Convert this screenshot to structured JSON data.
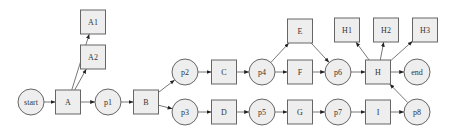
{
  "diagram": {
    "type": "petri-net-process-flow",
    "nodes": [
      {
        "id": "start",
        "label": "start",
        "shape": "circle",
        "x": 31,
        "y": 102
      },
      {
        "id": "A",
        "label": "A",
        "shape": "box",
        "x": 68,
        "y": 102
      },
      {
        "id": "A1",
        "label": "A1",
        "shape": "box",
        "x": 93,
        "y": 22
      },
      {
        "id": "A2",
        "label": "A2",
        "shape": "box",
        "x": 93,
        "y": 57
      },
      {
        "id": "p1",
        "label": "p1",
        "shape": "circle",
        "x": 108,
        "y": 102
      },
      {
        "id": "B",
        "label": "B",
        "shape": "box",
        "x": 146,
        "y": 102
      },
      {
        "id": "p2",
        "label": "p2",
        "shape": "circle",
        "x": 185,
        "y": 72
      },
      {
        "id": "p3",
        "label": "p3",
        "shape": "circle",
        "x": 185,
        "y": 112
      },
      {
        "id": "C",
        "label": "C",
        "shape": "box",
        "x": 224,
        "y": 72
      },
      {
        "id": "D",
        "label": "D",
        "shape": "box",
        "x": 224,
        "y": 112
      },
      {
        "id": "p4",
        "label": "p4",
        "shape": "circle",
        "x": 262,
        "y": 72
      },
      {
        "id": "p5",
        "label": "p5",
        "shape": "circle",
        "x": 262,
        "y": 112
      },
      {
        "id": "E",
        "label": "E",
        "shape": "box",
        "x": 300,
        "y": 31
      },
      {
        "id": "F",
        "label": "F",
        "shape": "box",
        "x": 300,
        "y": 72
      },
      {
        "id": "G",
        "label": "G",
        "shape": "box",
        "x": 300,
        "y": 112
      },
      {
        "id": "p6",
        "label": "p6",
        "shape": "circle",
        "x": 338,
        "y": 72
      },
      {
        "id": "p7",
        "label": "p7",
        "shape": "circle",
        "x": 338,
        "y": 112
      },
      {
        "id": "H1",
        "label": "H1",
        "shape": "box",
        "x": 347,
        "y": 30
      },
      {
        "id": "H2",
        "label": "H2",
        "shape": "box",
        "x": 386,
        "y": 30
      },
      {
        "id": "H3",
        "label": "H3",
        "shape": "box",
        "x": 425,
        "y": 30
      },
      {
        "id": "H",
        "label": "H",
        "shape": "box",
        "x": 378,
        "y": 72
      },
      {
        "id": "I",
        "label": "I",
        "shape": "box",
        "x": 378,
        "y": 112
      },
      {
        "id": "end",
        "label": "end",
        "shape": "circle",
        "x": 417,
        "y": 72
      },
      {
        "id": "p8",
        "label": "p8",
        "shape": "circle",
        "x": 417,
        "y": 112
      }
    ],
    "edges": [
      {
        "from": "start",
        "to": "A"
      },
      {
        "from": "A",
        "to": "A1"
      },
      {
        "from": "A",
        "to": "A2"
      },
      {
        "from": "A",
        "to": "p1"
      },
      {
        "from": "p1",
        "to": "B"
      },
      {
        "from": "B",
        "to": "p2"
      },
      {
        "from": "B",
        "to": "p3"
      },
      {
        "from": "p2",
        "to": "C"
      },
      {
        "from": "C",
        "to": "p4"
      },
      {
        "from": "p4",
        "to": "E"
      },
      {
        "from": "p4",
        "to": "F"
      },
      {
        "from": "E",
        "to": "p6"
      },
      {
        "from": "F",
        "to": "p6"
      },
      {
        "from": "p6",
        "to": "H"
      },
      {
        "from": "H",
        "to": "H1"
      },
      {
        "from": "H",
        "to": "H2"
      },
      {
        "from": "H",
        "to": "H3"
      },
      {
        "from": "H",
        "to": "end"
      },
      {
        "from": "p3",
        "to": "D"
      },
      {
        "from": "D",
        "to": "p5"
      },
      {
        "from": "p5",
        "to": "G"
      },
      {
        "from": "G",
        "to": "p7"
      },
      {
        "from": "p7",
        "to": "I"
      },
      {
        "from": "I",
        "to": "p8"
      },
      {
        "from": "p8",
        "to": "H"
      }
    ],
    "style": {
      "node_fill": "#eeeeee",
      "node_stroke": "#666666",
      "edge_color": "#555555",
      "background": "#ffffff"
    }
  }
}
